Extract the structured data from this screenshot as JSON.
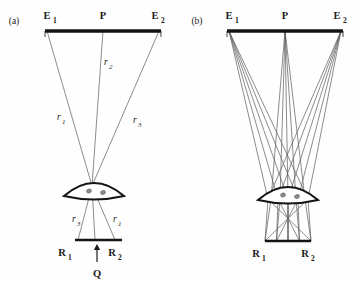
{
  "figure": {
    "background_color": "#fefefe",
    "ink_color": "#141414",
    "ray_color": "#5a5a5a",
    "width": 360,
    "height": 282
  },
  "panels": [
    {
      "id": "a",
      "tag": "(a)",
      "tag_x": 14,
      "tag_y": 24,
      "object_bar": {
        "x1": 45,
        "x2": 161,
        "y": 31,
        "thickness": 3.4,
        "tick_y2": 37
      },
      "points_top": [
        {
          "name": "E",
          "sub": "1",
          "label_x": 47,
          "label_y": 19,
          "node_x": 47
        },
        {
          "name": "P",
          "sub": "",
          "label_x": 103,
          "label_y": 19,
          "node_x": 103
        },
        {
          "name": "E",
          "sub": "2",
          "label_x": 155,
          "label_y": 19,
          "node_x": 159
        }
      ],
      "lens": {
        "cx": 94,
        "cy": 196,
        "half_width": 30,
        "top_rise": 13,
        "bottom_rise": 3.5
      },
      "node_above_lens": {
        "x": 92,
        "y": 186
      },
      "node_below_lens": {
        "x": 94,
        "y": 203
      },
      "image_bar": {
        "x1": 75,
        "x2": 122,
        "y": 240,
        "thickness": 2.6
      },
      "rays": [
        {
          "name": "r1",
          "from_x": 47,
          "to_x": 115
        },
        {
          "name": "r2",
          "from_x": 103,
          "to_x": 95
        },
        {
          "name": "r3",
          "from_x": 159,
          "to_x": 78
        }
      ],
      "points_bottom": [
        {
          "name": "R",
          "sub": "1",
          "label_x": 62,
          "label_y": 256
        },
        {
          "name": "R",
          "sub": "2",
          "label_x": 112,
          "label_y": 256
        }
      ],
      "ray_labels_upper": [
        {
          "text": "r",
          "sub": "1",
          "x": 57,
          "y": 120
        },
        {
          "text": "r",
          "sub": "2",
          "x": 104,
          "y": 65
        },
        {
          "text": "r",
          "sub": "3",
          "x": 133,
          "y": 123
        }
      ],
      "ray_labels_lower": [
        {
          "text": "r",
          "sub": "3",
          "x": 72,
          "y": 222
        },
        {
          "text": "r",
          "sub": "1",
          "x": 113,
          "y": 222
        }
      ],
      "source_arrow": {
        "x": 97,
        "y_tail": 262,
        "y_head": 244,
        "label": "Q",
        "label_x": 97,
        "label_y": 277
      }
    },
    {
      "id": "b",
      "tag": "(b)",
      "tag_x": 197,
      "tag_y": 24,
      "object_bar": {
        "x1": 227,
        "x2": 343,
        "y": 31,
        "thickness": 3.4,
        "tick_y2": 37
      },
      "points_top": [
        {
          "name": "E",
          "sub": "1",
          "label_x": 229,
          "label_y": 19,
          "node_x": 229
        },
        {
          "name": "P",
          "sub": "",
          "label_x": 285,
          "label_y": 19,
          "node_x": 285
        },
        {
          "name": "E",
          "sub": "2",
          "label_x": 337,
          "label_y": 19,
          "node_x": 341
        }
      ],
      "lens": {
        "cx": 288,
        "cy": 200,
        "half_width": 30,
        "top_rise": 13,
        "bottom_rise": 3.5
      },
      "aperture_x": [
        268,
        278,
        288,
        298,
        308
      ],
      "image_bar": {
        "x1": 265,
        "x2": 311,
        "y": 241,
        "thickness": 2.6
      },
      "points_bottom": [
        {
          "name": "R",
          "sub": "1",
          "label_x": 256,
          "label_y": 257
        },
        {
          "name": "R",
          "sub": "2",
          "label_x": 305,
          "label_y": 257
        }
      ],
      "ray_bundles": [
        {
          "from_x": 229,
          "to_x": 308,
          "fan": [
            268,
            278,
            288,
            298,
            308
          ]
        },
        {
          "from_x": 285,
          "to_x": 288,
          "fan": [
            271,
            280,
            288,
            296,
            305
          ]
        },
        {
          "from_x": 341,
          "to_x": 268,
          "fan": [
            268,
            278,
            288,
            298,
            308
          ]
        }
      ]
    }
  ]
}
